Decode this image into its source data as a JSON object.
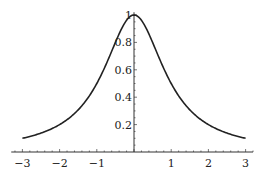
{
  "chart_data": {
    "type": "line",
    "title": "",
    "xlabel": "",
    "ylabel": "",
    "function": "1/(1+x^2)",
    "xlim": [
      -3.3,
      3.2
    ],
    "ylim": [
      0,
      1.0
    ],
    "grid": false,
    "x_ticks": [
      -3,
      -2,
      -1,
      1,
      2,
      3
    ],
    "x_tick_labels": [
      "−3",
      "−2",
      "−1",
      "1",
      "2",
      "3"
    ],
    "y_ticks": [
      0.2,
      0.4,
      0.6,
      0.8,
      1
    ],
    "y_tick_labels": [
      "0.2",
      "0.4",
      "0.6",
      "0.8",
      "1"
    ],
    "series": [
      {
        "name": "f(x)",
        "x": [
          -3,
          -2.5,
          -2,
          -1.5,
          -1,
          -0.75,
          -0.5,
          -0.25,
          0,
          0.25,
          0.5,
          0.75,
          1,
          1.5,
          2,
          2.5,
          3
        ],
        "y": [
          0.1,
          0.138,
          0.2,
          0.308,
          0.5,
          0.64,
          0.8,
          0.941,
          1.0,
          0.941,
          0.8,
          0.64,
          0.5,
          0.308,
          0.2,
          0.138,
          0.1
        ]
      }
    ]
  }
}
